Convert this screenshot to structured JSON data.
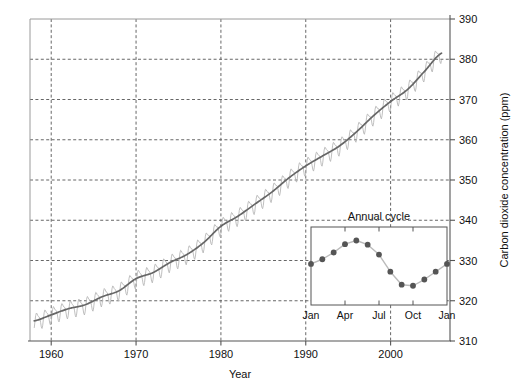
{
  "chart_data": {
    "type": "line",
    "title": "",
    "xlabel": "Year",
    "ylabel": "Carbon dioxide concentration (ppm)",
    "xlim": [
      1957.5,
      2007.0
    ],
    "ylim": [
      310,
      390
    ],
    "grid": true,
    "legend_position": "none",
    "xticks": [
      1960,
      1970,
      1980,
      1990,
      2000
    ],
    "xtick_labels": [
      "1960",
      "1970",
      "1980",
      "1990",
      "2000"
    ],
    "yticks": [
      310,
      320,
      330,
      340,
      350,
      360,
      370,
      380,
      390
    ],
    "ytick_labels": [
      "310",
      "320",
      "330",
      "340",
      "350",
      "360",
      "370",
      "380",
      "390"
    ],
    "series": [
      {
        "name": "Monthly mean CO2 (raw, with annual cycle)",
        "color": "#b4b4b4",
        "style": "oscillating",
        "note": "Monthly values oscillate about the trend with a seasonal amplitude of about 3 ppm peak-to-trough each year",
        "amplitude_ppm": 3.0,
        "peak_month": "May",
        "trough_month": "September"
      },
      {
        "name": "Smoothed trend",
        "color": "#666666",
        "style": "smooth",
        "x": [
          1958,
          1960,
          1962,
          1964,
          1966,
          1968,
          1970,
          1972,
          1974,
          1976,
          1978,
          1980,
          1982,
          1984,
          1986,
          1988,
          1990,
          1992,
          1994,
          1996,
          1998,
          2000,
          2002,
          2004,
          2006
        ],
        "values": [
          315.0,
          316.5,
          318.0,
          319.0,
          321.0,
          322.5,
          325.5,
          327.0,
          329.5,
          331.5,
          334.5,
          338.5,
          341.0,
          344.0,
          347.0,
          350.5,
          353.5,
          356.0,
          358.5,
          362.0,
          366.0,
          369.5,
          372.5,
          377.0,
          381.5
        ]
      }
    ],
    "inset": {
      "type": "line",
      "title": "Annual cycle",
      "xlabel": "",
      "ylabel": "",
      "marker": "filled-circle",
      "marker_color": "#555555",
      "line_color": "#bbbbbb",
      "categories": [
        "Jan",
        "Feb",
        "Mar",
        "Apr",
        "May",
        "Jun",
        "Jul",
        "Aug",
        "Sep",
        "Oct",
        "Nov",
        "Dec",
        "Jan"
      ],
      "xticks": [
        "Jan",
        "Apr",
        "Jul",
        "Oct",
        "Jan"
      ],
      "values": [
        328.4,
        329.3,
        330.6,
        332.2,
        332.9,
        332.1,
        330.2,
        326.9,
        324.4,
        324.2,
        325.4,
        326.9,
        328.4
      ],
      "ylim": [
        320.5,
        335.5
      ],
      "grid": false
    }
  },
  "axes": {
    "x_title": "Year",
    "y_title": "Carbon dioxide concentration (ppm)"
  }
}
